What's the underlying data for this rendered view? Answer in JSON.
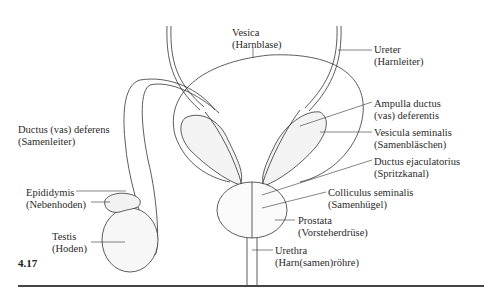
{
  "figure": {
    "number": "4.17",
    "labels": {
      "vesica": {
        "latin": "Vesica",
        "german": "(Harnblase)"
      },
      "ureter": {
        "latin": "Ureter",
        "german": "(Harnleiter)"
      },
      "ampulla": {
        "latin": "Ampulla ductus",
        "german": "(vas) deferentis"
      },
      "vesicula": {
        "latin": "Vesicula seminalis",
        "german": "(Samenbläschen)"
      },
      "ductus_ejac": {
        "latin": "Ductus ejaculatorius",
        "german": "(Spritzkanal)"
      },
      "colliculus": {
        "latin": "Colliculus seminalis",
        "german": "(Samenhügel)"
      },
      "prostata": {
        "latin": "Prostata",
        "german": "(Vorsteherdrüse)"
      },
      "urethra": {
        "latin": "Urethra",
        "german": "(Harn(samen)röhre)"
      },
      "ductus_def": {
        "latin": "Ductus (vas) deferens",
        "german": "(Samenleiter)"
      },
      "epididymis": {
        "latin": "Epididymis",
        "german": "(Nebenhoden)"
      },
      "testis": {
        "latin": "Testis",
        "german": "(Hoden)"
      }
    }
  }
}
